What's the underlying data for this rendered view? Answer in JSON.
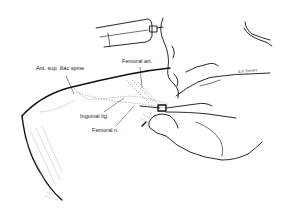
{
  "figure": {
    "labels": {
      "ant_sup_iliac_spine": "Ant. sup. iliac spine",
      "femoral_art": "Femoral art.",
      "inguinal_lig": "Inguinal lig.",
      "femoral_n": "Femoral n."
    },
    "signature": "S.P. Somers"
  }
}
